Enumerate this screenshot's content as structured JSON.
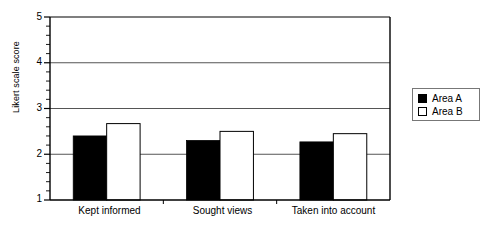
{
  "chart_data": {
    "type": "bar",
    "title": "",
    "xlabel": "",
    "ylabel": "Likert scale score",
    "categories": [
      "Kept informed",
      "Sought views",
      "Taken into account"
    ],
    "series": [
      {
        "name": "Area A",
        "color": "#000000",
        "values": [
          2.4,
          2.3,
          2.27
        ]
      },
      {
        "name": "Area B",
        "color": "#ffffff",
        "values": [
          2.67,
          2.5,
          2.45
        ]
      }
    ],
    "ylim": [
      1,
      5
    ],
    "yticks": [
      1,
      2,
      3,
      4,
      5
    ],
    "ytick_labels": [
      "1",
      "2",
      "3",
      "4",
      "5"
    ],
    "minor_ticks": true,
    "grid": "horizontal",
    "legend_position": "right",
    "legend_entries": [
      "Area A",
      "Area B"
    ]
  },
  "axis": {
    "y_label": "Likert scale score",
    "tick_1": "1",
    "tick_2": "2",
    "tick_3": "3",
    "tick_4": "4",
    "tick_5": "5"
  },
  "xaxis": {
    "cat_0": "Kept informed",
    "cat_1": "Sought views",
    "cat_2": "Taken into account"
  },
  "legend": {
    "area_a": "Area A",
    "area_b": "Area B"
  },
  "colors": {
    "series_a": "#000000",
    "series_b": "#ffffff",
    "axis": "#000000",
    "grid": "#555555",
    "legend_border": "#777777"
  }
}
